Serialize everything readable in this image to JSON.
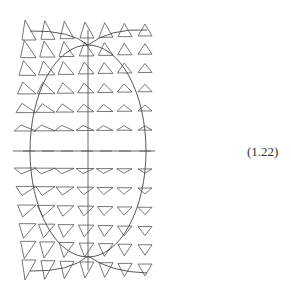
{
  "equation_number": "(1.22)",
  "top_caption_fragment": "· · ·",
  "figure": {
    "stroke_color": "#444444",
    "triangle_color": "#555555",
    "axis": {
      "h": {
        "x1": 13,
        "x2": 155,
        "y": 151
      },
      "v": {
        "x": 88,
        "y1": 30,
        "y2": 270
      }
    },
    "ellipse": {
      "cx": 88,
      "cy": 151,
      "rx": 58,
      "ry": 106
    },
    "columns": [
      29,
      48,
      67,
      87,
      106,
      125,
      145
    ],
    "rows": [
      {
        "y": 30,
        "dir": -1,
        "mag": 1.0
      },
      {
        "y": 49,
        "dir": -1,
        "mag": 0.85
      },
      {
        "y": 68,
        "dir": -1,
        "mag": 0.7
      },
      {
        "y": 88,
        "dir": -1,
        "mag": 0.55
      },
      {
        "y": 108,
        "dir": -1,
        "mag": 0.4
      },
      {
        "y": 128,
        "dir": -1,
        "mag": 0.22
      },
      {
        "y": 171,
        "dir": 1,
        "mag": 0.22
      },
      {
        "y": 191,
        "dir": 1,
        "mag": 0.4
      },
      {
        "y": 211,
        "dir": 1,
        "mag": 0.55
      },
      {
        "y": 231,
        "dir": 1,
        "mag": 0.7
      },
      {
        "y": 250,
        "dir": 1,
        "mag": 0.85
      },
      {
        "y": 270,
        "dir": 1,
        "mag": 1.0
      }
    ]
  }
}
